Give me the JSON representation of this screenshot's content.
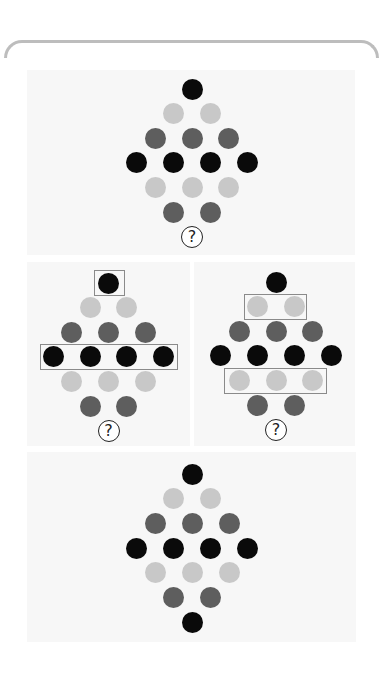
{
  "colors": {
    "black": "#0a0a0a",
    "dark_gray": "#5e5e5e",
    "light_gray": "#c8c8c8",
    "panel_bg": "#f7f7f7",
    "highlight_box": "#8a8a8a",
    "bracket": "#bdbdbd"
  },
  "question_symbol": "?",
  "panels": [
    {
      "id": "question-panel",
      "rows": [
        [
          "black"
        ],
        [
          "light",
          "light"
        ],
        [
          "dark",
          "dark",
          "dark"
        ],
        [
          "black",
          "black",
          "black",
          "black"
        ],
        [
          "light",
          "light",
          "light"
        ],
        [
          "dark",
          "dark"
        ],
        [
          "?"
        ]
      ]
    },
    {
      "id": "hint-panel-left",
      "highlighted_rows": [
        1,
        4
      ],
      "rows": [
        [
          "black"
        ],
        [
          "light",
          "light"
        ],
        [
          "dark",
          "dark",
          "dark"
        ],
        [
          "black",
          "black",
          "black",
          "black"
        ],
        [
          "light",
          "light",
          "light"
        ],
        [
          "dark",
          "dark"
        ],
        [
          "?"
        ]
      ]
    },
    {
      "id": "hint-panel-right",
      "highlighted_rows": [
        2,
        5
      ],
      "rows": [
        [
          "black"
        ],
        [
          "light",
          "light"
        ],
        [
          "dark",
          "dark",
          "dark"
        ],
        [
          "black",
          "black",
          "black",
          "black"
        ],
        [
          "light",
          "light",
          "light"
        ],
        [
          "dark",
          "dark"
        ],
        [
          "?"
        ]
      ]
    },
    {
      "id": "answer-panel",
      "rows": [
        [
          "black"
        ],
        [
          "light",
          "light"
        ],
        [
          "dark",
          "dark",
          "dark"
        ],
        [
          "black",
          "black",
          "black",
          "black"
        ],
        [
          "light",
          "light",
          "light"
        ],
        [
          "dark",
          "dark"
        ],
        [
          "black"
        ]
      ]
    }
  ]
}
